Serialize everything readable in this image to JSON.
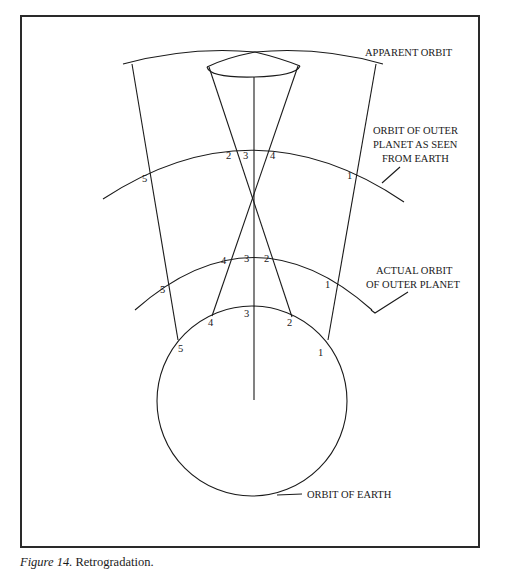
{
  "figure": {
    "caption_label": "Figure 14.",
    "caption_text": " Retrogradation."
  },
  "labels": {
    "apparent_orbit": "APPARENT ORBIT",
    "orbit_seen_line1": "ORBIT OF OUTER",
    "orbit_seen_line2": "PLANET AS SEEN",
    "orbit_seen_line3": "FROM EARTH",
    "actual_orbit_line1": "ACTUAL ORBIT",
    "actual_orbit_line2": "OF OUTER PLANET",
    "orbit_earth": "ORBIT OF EARTH"
  },
  "positions": {
    "seen": [
      "1",
      "2",
      "3",
      "4",
      "5"
    ],
    "actual": [
      "1",
      "2",
      "3",
      "4",
      "5"
    ],
    "earth": [
      "1",
      "2",
      "3",
      "4",
      "5"
    ]
  },
  "colors": {
    "line": "#1a1a1a",
    "background": "#ffffff"
  }
}
